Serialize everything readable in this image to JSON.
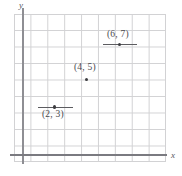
{
  "figure": {
    "background_color": "#ffffff",
    "grid_color": "#d2d2d4",
    "axis_color": "#8e8e93",
    "point_color": "#3c3c40",
    "label_color": "#4a4a4e"
  },
  "axes": {
    "x_label": "x",
    "y_label": "y"
  },
  "chart_data": {
    "type": "scatter",
    "title": "",
    "xlabel": "x",
    "ylabel": "y",
    "grid": true,
    "legend": "none",
    "xlim": [
      0,
      9
    ],
    "ylim": [
      0,
      8
    ],
    "x_ticks": [],
    "y_ticks": [],
    "grid_columns": 9,
    "grid_rows": 8,
    "points": [
      {
        "label": "(6, 7)",
        "x": 6,
        "y": 7,
        "label_position": "above",
        "has_segment": true
      },
      {
        "label": "(4, 5)",
        "x": 4,
        "y": 5,
        "label_position": "above",
        "has_segment": false
      },
      {
        "label": "(2, 3)",
        "x": 2,
        "y": 3,
        "label_position": "below",
        "has_segment": true
      }
    ]
  }
}
